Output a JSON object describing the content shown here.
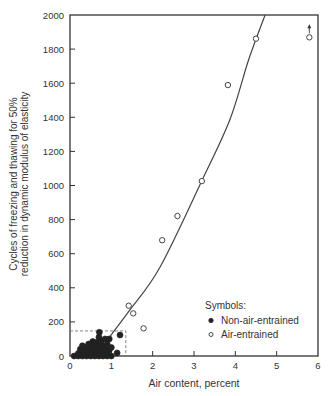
{
  "chart_data": {
    "type": "scatter",
    "title": "",
    "xlabel": "Air content, percent",
    "ylabel_lines": [
      "Cycles of freezing and thawing for 50%",
      "reduction in dynamic modulus of elasticity"
    ],
    "xlim": [
      0,
      6
    ],
    "ylim": [
      0,
      2000
    ],
    "x_ticks": [
      0,
      1,
      2,
      3,
      4,
      5,
      6
    ],
    "y_ticks": [
      0,
      200,
      400,
      600,
      800,
      1000,
      1200,
      1400,
      1600,
      1800,
      2000
    ],
    "grid": false,
    "legend": {
      "title": "Symbols:",
      "position": "lower right",
      "entries": [
        {
          "label": "Non-air-entrained",
          "marker": "filled-circle"
        },
        {
          "label": "Air-entrained",
          "marker": "open-circle"
        }
      ]
    },
    "series": [
      {
        "name": "Non-air-entrained",
        "marker": "filled-circle",
        "points": [
          [
            0.1,
            0
          ],
          [
            0.2,
            0
          ],
          [
            0.3,
            0
          ],
          [
            0.35,
            10
          ],
          [
            0.4,
            0
          ],
          [
            0.45,
            20
          ],
          [
            0.5,
            0
          ],
          [
            0.55,
            5
          ],
          [
            0.6,
            0
          ],
          [
            0.65,
            10
          ],
          [
            0.7,
            0
          ],
          [
            0.75,
            5
          ],
          [
            0.8,
            0
          ],
          [
            0.85,
            15
          ],
          [
            0.9,
            0
          ],
          [
            1.0,
            0
          ],
          [
            0.25,
            40
          ],
          [
            0.3,
            60
          ],
          [
            0.35,
            30
          ],
          [
            0.4,
            50
          ],
          [
            0.45,
            70
          ],
          [
            0.5,
            40
          ],
          [
            0.55,
            60
          ],
          [
            0.6,
            30
          ],
          [
            0.65,
            80
          ],
          [
            0.7,
            50
          ],
          [
            0.75,
            90
          ],
          [
            0.8,
            60
          ],
          [
            0.85,
            40
          ],
          [
            0.9,
            70
          ],
          [
            0.95,
            100
          ],
          [
            0.4,
            20
          ],
          [
            0.5,
            25
          ],
          [
            0.6,
            55
          ],
          [
            0.7,
            20
          ],
          [
            0.8,
            30
          ],
          [
            0.9,
            20
          ],
          [
            0.55,
            85
          ],
          [
            0.7,
            110
          ],
          [
            0.71,
            139
          ],
          [
            0.85,
            100
          ],
          [
            1.0,
            50
          ],
          [
            1.21,
            123
          ],
          [
            1.14,
            18
          ],
          [
            0.3,
            25
          ],
          [
            0.2,
            15
          ],
          [
            0.65,
            45
          ],
          [
            0.75,
            70
          ],
          [
            0.95,
            35
          ]
        ]
      },
      {
        "name": "Air-entrained",
        "marker": "open-circle",
        "points": [
          [
            1.42,
            295
          ],
          [
            1.53,
            250
          ],
          [
            1.78,
            162
          ],
          [
            2.23,
            679
          ],
          [
            2.6,
            821
          ],
          [
            3.19,
            1026
          ],
          [
            3.82,
            1589
          ],
          [
            4.5,
            1861
          ],
          [
            5.79,
            1869
          ]
        ],
        "annotations": [
          {
            "point": [
              5.79,
              1869
            ],
            "note": "arrow-up (value exceeds shown)"
          }
        ]
      }
    ],
    "fit_curve": {
      "name": "trend",
      "points": [
        [
          0.9,
          94
        ],
        [
          1.45,
          270
        ],
        [
          2.18,
          522
        ],
        [
          3.19,
          1028
        ],
        [
          3.87,
          1387
        ],
        [
          4.32,
          1736
        ],
        [
          4.72,
          2000
        ]
      ]
    },
    "reference_box": {
      "style": "dashed",
      "x": [
        0,
        1.35
      ],
      "y": [
        0,
        147
      ]
    }
  }
}
